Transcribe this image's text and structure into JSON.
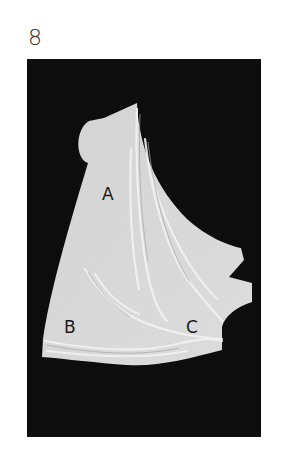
{
  "figure": {
    "number": "8",
    "background_color": "#0d0d0d",
    "fabric_color": "#d8d8d8",
    "labels": [
      {
        "text": "A"
      },
      {
        "text": "B"
      },
      {
        "text": "C"
      }
    ]
  }
}
